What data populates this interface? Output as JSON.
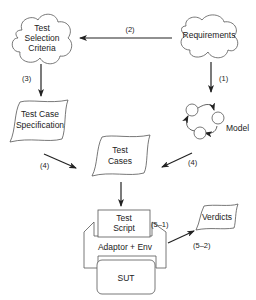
{
  "diagram": {
    "nodes": {
      "test_selection_criteria": {
        "line1": "Test",
        "line2": "Selection",
        "line3": "Criteria",
        "shape": "cloud"
      },
      "requirements": {
        "label": "Requirements",
        "shape": "cloud"
      },
      "model": {
        "label": "Model",
        "shape": "state-machine"
      },
      "test_case_specification": {
        "line1": "Test Case",
        "line2": "Specification",
        "shape": "document"
      },
      "test_cases": {
        "line1": "Test",
        "line2": "Cases",
        "shape": "document"
      },
      "test_script": {
        "line1": "Test",
        "line2": "Script",
        "shape": "box"
      },
      "adaptor_env": {
        "label": "Adaptor + Env",
        "shape": "frame"
      },
      "sut": {
        "label": "SUT",
        "shape": "rounded-box"
      },
      "verdicts": {
        "label": "Verdicts",
        "shape": "document"
      }
    },
    "edges": [
      {
        "from": "requirements",
        "to": "test_selection_criteria",
        "label": "(2)"
      },
      {
        "from": "requirements",
        "to": "model",
        "label": "(1)"
      },
      {
        "from": "test_selection_criteria",
        "to": "test_case_specification",
        "label": "(3)"
      },
      {
        "from": "test_case_specification",
        "to": "test_cases",
        "label": "(4)"
      },
      {
        "from": "model",
        "to": "test_cases",
        "label": "(4)"
      },
      {
        "from": "test_cases",
        "to": "test_script",
        "label": ""
      },
      {
        "from": "test_script",
        "to": "adaptor_env",
        "label": "(5–1)"
      },
      {
        "from": "adaptor_env",
        "to": "verdicts",
        "label": "(5–2)"
      }
    ]
  }
}
